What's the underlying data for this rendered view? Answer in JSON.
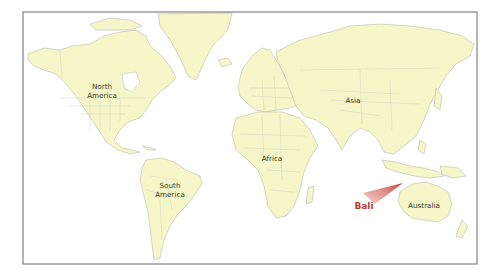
{
  "map": {
    "title": "World map highlighting Bali",
    "colors": {
      "land": "#f6f6c9",
      "ocean": "#ffffff",
      "border": "#b9bcae",
      "frame": "#6a6a6a",
      "highlight": "#c0392b"
    },
    "labels": {
      "north_america_line1": "North",
      "north_america_line2": "America",
      "south_america_line1": "South",
      "south_america_line2": "America",
      "africa": "Africa",
      "asia": "Asia",
      "australia": "Australia",
      "bali": "Bali"
    },
    "highlight": {
      "name": "Bali",
      "pointer": "red-wedge-pointer"
    }
  }
}
